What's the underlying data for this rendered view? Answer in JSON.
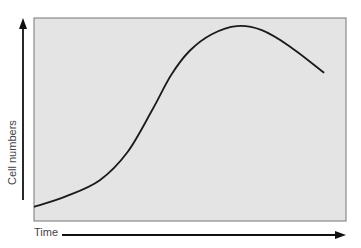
{
  "chart_data": {
    "type": "line",
    "title": "",
    "xlabel": "Time",
    "ylabel": "Cell numbers",
    "grid": false,
    "legend": null,
    "axes": {
      "x_arrow": true,
      "y_arrow": true,
      "ticks": false
    },
    "background_color": "#e4e4e4",
    "line_color": "#1a1a1a",
    "series": [
      {
        "name": "Cell growth curve",
        "points_normalized": [
          [
            0.0,
            0.07
          ],
          [
            0.1,
            0.12
          ],
          [
            0.21,
            0.2
          ],
          [
            0.3,
            0.34
          ],
          [
            0.38,
            0.55
          ],
          [
            0.44,
            0.72
          ],
          [
            0.5,
            0.84
          ],
          [
            0.57,
            0.92
          ],
          [
            0.65,
            0.96
          ],
          [
            0.73,
            0.94
          ],
          [
            0.82,
            0.86
          ],
          [
            0.93,
            0.73
          ]
        ]
      }
    ]
  },
  "labels": {
    "y_axis": "Cell numbers",
    "x_axis": "Time"
  }
}
